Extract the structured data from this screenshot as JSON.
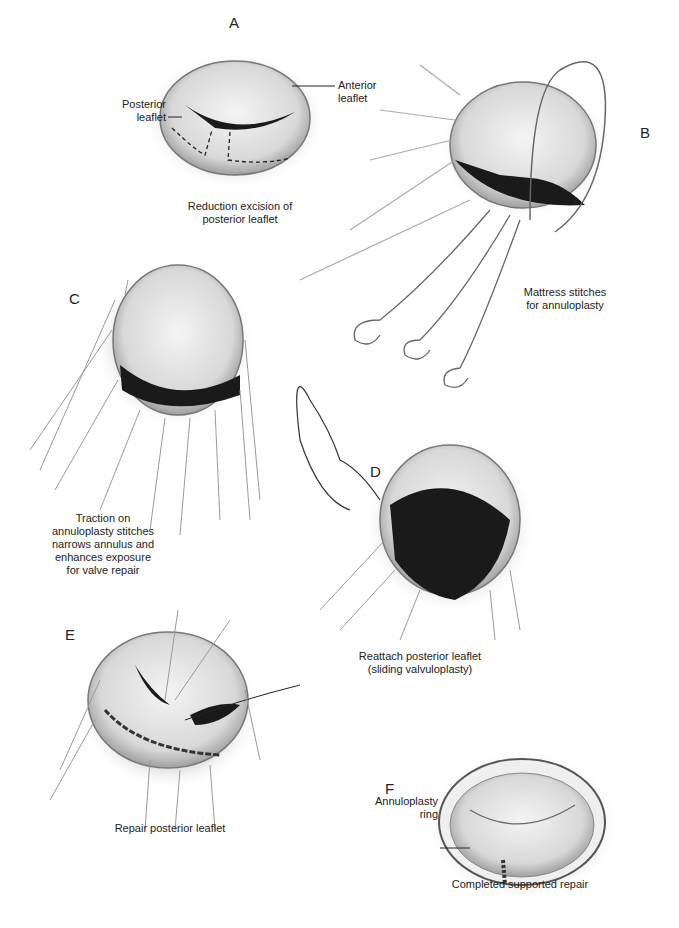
{
  "figure": {
    "panels": [
      {
        "letter": "A",
        "caption_lines": [
          "Reduction excision of",
          "posterior leaflet"
        ],
        "labels": [
          {
            "line1": "Posterior",
            "line2": "leaflet"
          },
          {
            "line1": "Anterior",
            "line2": "leaflet"
          }
        ]
      },
      {
        "letter": "B",
        "caption_lines": [
          "Mattress stitches",
          "for annuloplasty"
        ]
      },
      {
        "letter": "C",
        "caption_lines": [
          "Traction on",
          "annuloplasty stitches",
          "narrows annulus and",
          "enhances exposure",
          "for valve repair"
        ]
      },
      {
        "letter": "D",
        "caption_lines": [
          "Reattach posterior leaflet",
          "(sliding valvuloplasty)"
        ]
      },
      {
        "letter": "E",
        "caption_lines": [
          "Repair posterior leaflet"
        ]
      },
      {
        "letter": "F",
        "caption_lines": [
          "Completed supported repair"
        ],
        "labels": [
          {
            "line1": "Annuloplasty",
            "line2": "ring"
          }
        ]
      }
    ]
  }
}
